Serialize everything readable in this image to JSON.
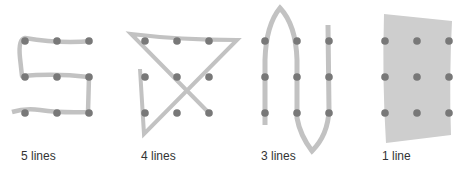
{
  "colors": {
    "dot": "#787878",
    "line": "#c2c2c2",
    "band": "#cecece",
    "label": "#333333"
  },
  "grid": {
    "rows": 3,
    "cols": 3
  },
  "panels": [
    {
      "label": "5 lines",
      "lines": 5
    },
    {
      "label": "4 lines",
      "lines": 4
    },
    {
      "label": "3 lines",
      "lines": 3
    },
    {
      "label": "1 line",
      "lines": 1
    }
  ]
}
